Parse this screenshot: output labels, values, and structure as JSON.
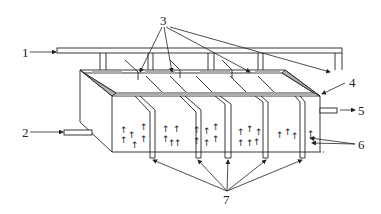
{
  "diagram": {
    "type": "technical line drawing",
    "stroke_color": "#222222",
    "background": "#ffffff",
    "labels": [
      {
        "id": "1",
        "text": "1",
        "points_to": "inlet pipe (top)"
      },
      {
        "id": "2",
        "text": "2",
        "points_to": "side inlet pipe"
      },
      {
        "id": "3",
        "text": "3",
        "points_to": "distribution nozzles / baffles (3 arrows)"
      },
      {
        "id": "4",
        "text": "4",
        "points_to": "tank top rim"
      },
      {
        "id": "5",
        "text": "5",
        "points_to": "outlet pipe"
      },
      {
        "id": "6",
        "text": "6",
        "points_to": "rising bubbles (2 arrows)"
      },
      {
        "id": "7",
        "text": "7",
        "points_to": "bottom discharge tubes (5 arrows)"
      }
    ]
  }
}
